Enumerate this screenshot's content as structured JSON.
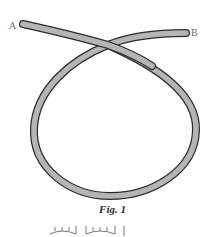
{
  "figure": {
    "caption": "Fig. 1",
    "endpoints": {
      "a_label": "A",
      "b_label": "B"
    },
    "rope": {
      "fill_color": "#b5b5b5",
      "outline_color": "#2b2b2b",
      "description": "Rope forming a single loop, crossing over itself near the top"
    }
  }
}
